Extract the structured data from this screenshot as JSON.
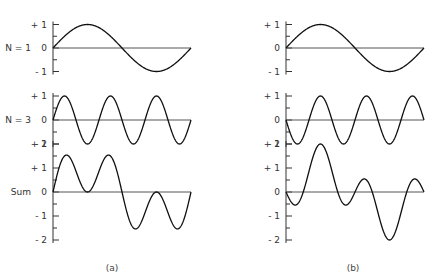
{
  "figure": {
    "panels": [
      {
        "id": "a",
        "caption": "(a)",
        "rows": [
          {
            "label": "N = 1",
            "ticks": [
              "+ 1",
              "0",
              "- 1"
            ]
          },
          {
            "label": "N = 3",
            "ticks": [
              "+ 1",
              "0",
              "- 1"
            ]
          },
          {
            "label": "Sum",
            "ticks": [
              "+ 2",
              "+ 1",
              "0",
              "- 1",
              "- 2"
            ]
          }
        ]
      },
      {
        "id": "b",
        "caption": "(b)",
        "rows": [
          {
            "label": "",
            "ticks": [
              "+ 1",
              "0",
              "- 1"
            ]
          },
          {
            "label": "",
            "ticks": [
              "+ 1",
              "0",
              "- 1"
            ]
          },
          {
            "label": "",
            "ticks": [
              "+ 2",
              "+ 1",
              "0",
              "- 1",
              "- 2"
            ]
          }
        ]
      }
    ]
  },
  "chart_data": [
    {
      "type": "line",
      "title": "(a)",
      "x": "0 to 2π (one period of fundamental)",
      "series": [
        {
          "name": "N = 1",
          "formula": "sin(x)",
          "ylim": [
            -1,
            1
          ]
        },
        {
          "name": "N = 3",
          "formula": "sin(3x)",
          "ylim": [
            -1,
            1
          ]
        },
        {
          "name": "Sum",
          "formula": "sin(x) + sin(3x)",
          "ylim": [
            -2,
            2
          ]
        }
      ]
    },
    {
      "type": "line",
      "title": "(b)",
      "x": "0 to 2π (one period of fundamental)",
      "series": [
        {
          "name": "N = 1",
          "formula": "sin(x)",
          "ylim": [
            -1,
            1
          ]
        },
        {
          "name": "N = 3",
          "formula": "-sin(3x)",
          "ylim": [
            -1,
            1
          ]
        },
        {
          "name": "Sum",
          "formula": "sin(x) - sin(3x)",
          "ylim": [
            -2,
            2
          ]
        }
      ]
    }
  ]
}
